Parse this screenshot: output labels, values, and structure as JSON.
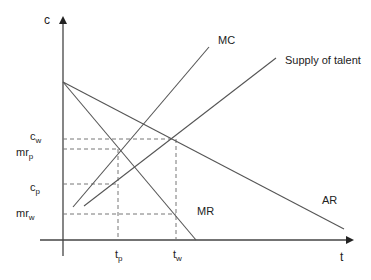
{
  "diagram": {
    "axes": {
      "y_label": "c",
      "x_label": "t"
    },
    "curves": {
      "mc": {
        "label": "MC"
      },
      "supply": {
        "label": "Supply of talent"
      },
      "mr": {
        "label": "MR"
      },
      "ar": {
        "label": "AR"
      }
    },
    "y_ticks": [
      {
        "main": "c",
        "sub": "w"
      },
      {
        "main": "mr",
        "sub": "p"
      },
      {
        "main": "c",
        "sub": "p"
      },
      {
        "main": "mr",
        "sub": "w"
      }
    ],
    "x_ticks": [
      {
        "main": "t",
        "sub": "p"
      },
      {
        "main": "t",
        "sub": "w"
      }
    ],
    "colors": {
      "line": "#555555",
      "axis": "#444444",
      "guide": "#777777",
      "text": "#222222"
    }
  }
}
